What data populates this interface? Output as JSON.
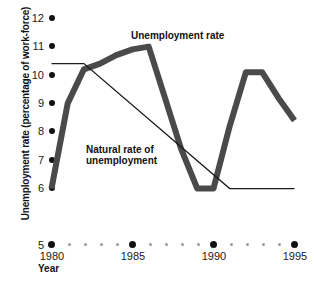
{
  "chart_data": {
    "type": "line",
    "title": "",
    "xlabel": "Year",
    "ylabel": "Unemployment rate (percentage of work-force)",
    "xlim": [
      1980,
      1995
    ],
    "ylim": [
      5,
      12
    ],
    "grid": false,
    "legend_position": "inline-annotations",
    "y_ticks": [
      12,
      11,
      10,
      9,
      8,
      7,
      6,
      5
    ],
    "y_tick_labels": [
      "12",
      "11",
      "10",
      "9",
      "8",
      "7",
      "6",
      "5"
    ],
    "x_ticks": [
      1980,
      1981,
      1982,
      1983,
      1984,
      1985,
      1986,
      1987,
      1988,
      1989,
      1990,
      1991,
      1992,
      1993,
      1994,
      1995
    ],
    "x_tick_labels_major": [
      "1980",
      "1985",
      "1990",
      "1995"
    ],
    "x_major_years": [
      1980,
      1985,
      1990,
      1995
    ],
    "series": [
      {
        "name": "Unemployment rate",
        "style": "thick",
        "color": "#4a4a4a",
        "x": [
          1980,
          1981,
          1982,
          1983,
          1984,
          1985,
          1986,
          1987,
          1988,
          1989,
          1990,
          1991,
          1992,
          1993,
          1994,
          1995
        ],
        "values": [
          6.0,
          9.0,
          10.2,
          10.4,
          10.7,
          10.9,
          11.0,
          9.2,
          7.4,
          6.0,
          6.0,
          8.2,
          10.1,
          10.1,
          9.2,
          8.4
        ]
      },
      {
        "name": "Natural rate of unemployment",
        "style": "thin",
        "color": "#1a1a1a",
        "x": [
          1980,
          1982,
          1991,
          1995
        ],
        "values": [
          10.4,
          10.4,
          6.0,
          6.0
        ]
      }
    ],
    "annotations": [
      {
        "id": "unemployment-rate",
        "text": "Unemployment rate",
        "x": 1985.0,
        "y": 11.7
      },
      {
        "id": "natural-rate",
        "text": "Natural rate of\nunemployment",
        "x": 1982.2,
        "y": 7.7
      }
    ]
  },
  "labels": {
    "y_axis_title": "Unemployment rate (percentage of work-force)",
    "x_axis_title": "Year",
    "series_unemployment": "Unemployment rate",
    "series_natural_line1": "Natural rate of",
    "series_natural_line2": "unemployment"
  },
  "colors": {
    "thick_series": "#4a4a4a",
    "thin_series": "#1a1a1a",
    "tick_major": "#111111",
    "tick_minor": "#9a9a9a",
    "text": "#1a1a1a",
    "background": "#ffffff"
  }
}
